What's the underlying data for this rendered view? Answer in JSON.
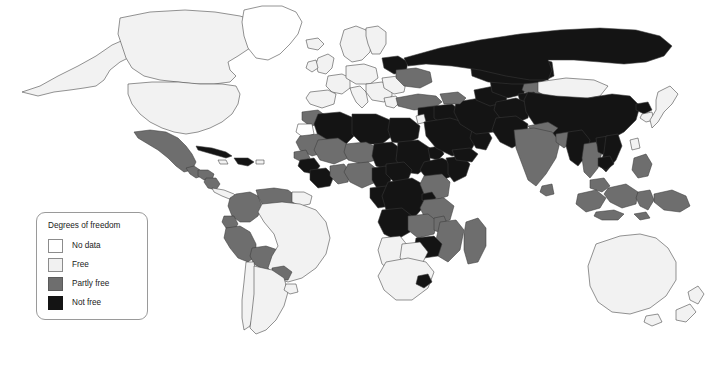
{
  "legend": {
    "title": "Degrees of freedom",
    "items": [
      {
        "label": "No data",
        "color": "#ffffff",
        "key": "nodata"
      },
      {
        "label": "Free",
        "color": "#f1f1f1",
        "key": "free"
      },
      {
        "label": "Partly free",
        "color": "#6e6e6e",
        "key": "partly"
      },
      {
        "label": "Not free",
        "color": "#141414",
        "key": "notfree"
      }
    ]
  },
  "map": {
    "type": "choropleth-world-map",
    "projection": "equirectangular",
    "background": "#ffffff",
    "border_color": "#3a3a3a",
    "categories": [
      "No data",
      "Free",
      "Partly free",
      "Not free"
    ],
    "regions": {
      "free": [
        "Canada",
        "United States",
        "Greenland",
        "Mexico-north",
        "Brazil",
        "Argentina",
        "Chile",
        "Uruguay",
        "Mongolia",
        "Japan",
        "South Korea",
        "Taiwan",
        "Australia",
        "New Zealand",
        "South Africa",
        "Namibia",
        "Botswana",
        "Madagascar-west",
        "United Kingdom",
        "Ireland",
        "France",
        "Spain",
        "Portugal",
        "Germany",
        "Italy",
        "Poland",
        "Norway",
        "Sweden",
        "Finland",
        "Greece",
        "Romania",
        "Bulgaria",
        "India-north",
        "Papua-east"
      ],
      "partly": [
        "Mexico",
        "Guatemala",
        "Honduras",
        "Nicaragua",
        "Colombia",
        "Venezuela",
        "Ecuador",
        "Peru",
        "Bolivia",
        "Paraguay",
        "Turkey",
        "Ukraine",
        "Georgia",
        "Kyrgyzstan",
        "India",
        "Nepal",
        "Sri Lanka",
        "Bangladesh",
        "Indonesia",
        "Malaysia",
        "Philippines",
        "Papua New Guinea",
        "Morocco",
        "Mauritania",
        "Mali",
        "Niger",
        "Nigeria",
        "Senegal",
        "Ghana",
        "Kenya",
        "Tanzania",
        "Zambia",
        "Mozambique",
        "Madagascar",
        "Malawi",
        "Uganda",
        "Guinea"
      ],
      "notfree": [
        "Cuba",
        "Haiti",
        "Russia",
        "Belarus",
        "China",
        "Kazakhstan",
        "Uzbekistan",
        "Turkmenistan",
        "Tajikistan",
        "Afghanistan",
        "Iran",
        "Iraq",
        "Saudi Arabia",
        "Syria",
        "Egypt",
        "Libya",
        "Algeria",
        "Sudan",
        "Chad",
        "Somalia",
        "Ethiopia",
        "Eritrea",
        "D.R. Congo",
        "Angola",
        "Zimbabwe",
        "Cameroon",
        "Liberia",
        "Sierra Leone",
        "Vietnam",
        "Laos",
        "Myanmar",
        "North Korea",
        "Pakistan",
        "Yemen",
        "Oman",
        "Burundi",
        "Rwanda",
        "Ivory Coast",
        "Togo",
        "Benin",
        "Burkina Faso"
      ]
    }
  }
}
